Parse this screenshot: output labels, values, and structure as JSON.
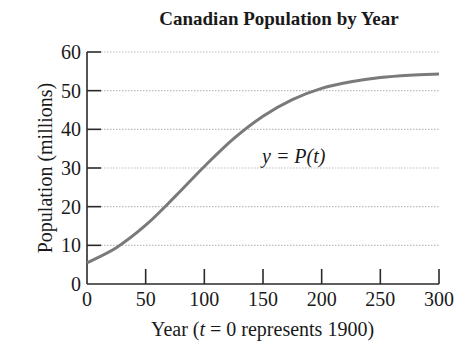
{
  "chart_data": {
    "type": "line",
    "title": "Canadian Population by Year",
    "xlabel": "Year (t = 0 represents 1900)",
    "xlabel_parts": {
      "prefix": "Year (",
      "var": "t",
      "suffix": " = 0 represents 1900)"
    },
    "ylabel": "Population (millions)",
    "xlim": [
      0,
      300
    ],
    "ylim": [
      0,
      60
    ],
    "x_ticks": [
      0,
      50,
      100,
      150,
      200,
      250,
      300
    ],
    "y_ticks": [
      0,
      10,
      20,
      30,
      40,
      50,
      60
    ],
    "grid": {
      "horizontal": true,
      "vertical": false,
      "style": "dotted"
    },
    "legend": null,
    "annotation": {
      "text": "y = P(t)",
      "x": 150,
      "y": 34
    },
    "series": [
      {
        "name": "y = P(t)",
        "x": [
          0,
          25,
          50,
          75,
          100,
          125,
          150,
          175,
          200,
          225,
          250,
          275,
          300
        ],
        "values": [
          5.5,
          9.4,
          15.2,
          22.6,
          30.4,
          37.6,
          43.4,
          47.7,
          50.6,
          52.3,
          53.4,
          54.0,
          54.3
        ]
      }
    ],
    "colors": {
      "curve": "#7a7a7a",
      "axis": "#2a2a2a",
      "grid": "#bdbdbd"
    }
  }
}
